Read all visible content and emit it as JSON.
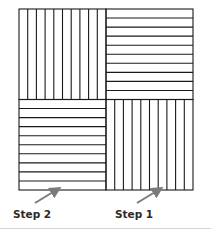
{
  "diagram": {
    "title": "",
    "square": {
      "x": 19,
      "y": 9,
      "size_w": 174,
      "size_h": 181,
      "stroke": "#1a1a1a"
    },
    "quadrants": [
      {
        "id": "top-left",
        "orientation": "vertical",
        "strips": 10
      },
      {
        "id": "top-right",
        "orientation": "horizontal",
        "strips": 10
      },
      {
        "id": "bottom-left",
        "orientation": "horizontal",
        "strips": 10
      },
      {
        "id": "bottom-right",
        "orientation": "vertical",
        "strips": 10
      }
    ],
    "arrows": [
      {
        "label": "Step 2",
        "from": [
          35,
          203
        ],
        "to": [
          58,
          189
        ],
        "color": "#7a7a7a"
      },
      {
        "label": "Step 1",
        "from": [
          137,
          203
        ],
        "to": [
          160,
          189
        ],
        "color": "#7a7a7a"
      }
    ],
    "labels": {
      "step2": "Step 2",
      "step1": "Step 1"
    },
    "caption": ""
  }
}
